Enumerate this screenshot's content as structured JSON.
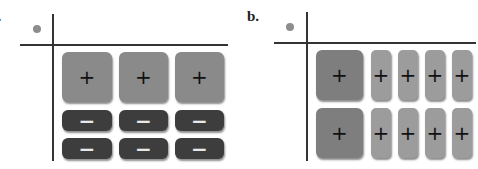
{
  "panels": [
    {
      "label": "a.",
      "tiles": {
        "positive_large": {
          "count": 3,
          "symbol": "+",
          "color": "#8a8a8a"
        },
        "negative_rect": {
          "count": 6,
          "rows": 2,
          "cols": 3,
          "symbol": "−",
          "color": "#3d3d3d"
        }
      }
    },
    {
      "label": "b.",
      "tiles": {
        "positive_large": {
          "count": 2,
          "symbol": "+",
          "color": "#7e7e7e"
        },
        "positive_rect": {
          "count": 8,
          "rows": 2,
          "cols": 4,
          "symbol": "+",
          "color": "#9c9c9c"
        }
      }
    }
  ],
  "dot_color": "#8d8d8d",
  "symbols": {
    "plus": "+",
    "minus": "−"
  }
}
